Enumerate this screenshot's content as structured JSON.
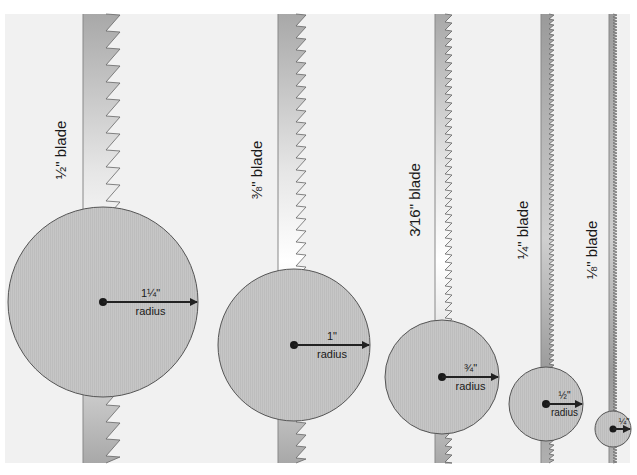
{
  "figure": {
    "colors": {
      "panel_bg": "#f1f1f1",
      "circle_fill": "#c8c8c8",
      "circle_stroke": "#555555",
      "blade_dark": "#a8a8a8",
      "blade_light": "#ffffff",
      "tooth_stroke": "#666666",
      "arrow": "#222222"
    },
    "blades": [
      {
        "id": "half",
        "label": "½\" blade",
        "radius_value": "1¼\"",
        "radius_word": "radius",
        "blade_x": 83,
        "blade_w": 37,
        "tooth_pitch": 17,
        "tooth_depth": 14,
        "cx": 103,
        "cy": 302,
        "r": 95,
        "label_x": 66,
        "label_y": 150
      },
      {
        "id": "three-eighths",
        "label": "⅜\" blade",
        "radius_value": "1\"",
        "radius_word": "radius",
        "blade_x": 278,
        "blade_w": 28,
        "tooth_pitch": 12,
        "tooth_depth": 10,
        "cx": 294,
        "cy": 345,
        "r": 76,
        "label_x": 262,
        "label_y": 170
      },
      {
        "id": "three-sixteenths",
        "label": "3⁄16\" blade",
        "radius_value": "¾\"",
        "radius_word": "radius",
        "blade_x": 435,
        "blade_w": 17,
        "tooth_pitch": 8,
        "tooth_depth": 7,
        "cx": 442,
        "cy": 377,
        "r": 57,
        "label_x": 420,
        "label_y": 200
      },
      {
        "id": "quarter",
        "label": "¼\" blade",
        "radius_value": "½\"",
        "radius_word": "radius",
        "blade_x": 541,
        "blade_w": 13,
        "tooth_pitch": 5,
        "tooth_depth": 5,
        "cx": 546,
        "cy": 404,
        "r": 37,
        "label_x": 528,
        "label_y": 230
      },
      {
        "id": "eighth",
        "label": "⅛\" blade",
        "radius_value": "¼\"",
        "radius_word": "",
        "blade_x": 609,
        "blade_w": 8,
        "tooth_pitch": 3,
        "tooth_depth": 4,
        "cx": 613,
        "cy": 429,
        "r": 18,
        "label_x": 597,
        "label_y": 250
      }
    ]
  }
}
